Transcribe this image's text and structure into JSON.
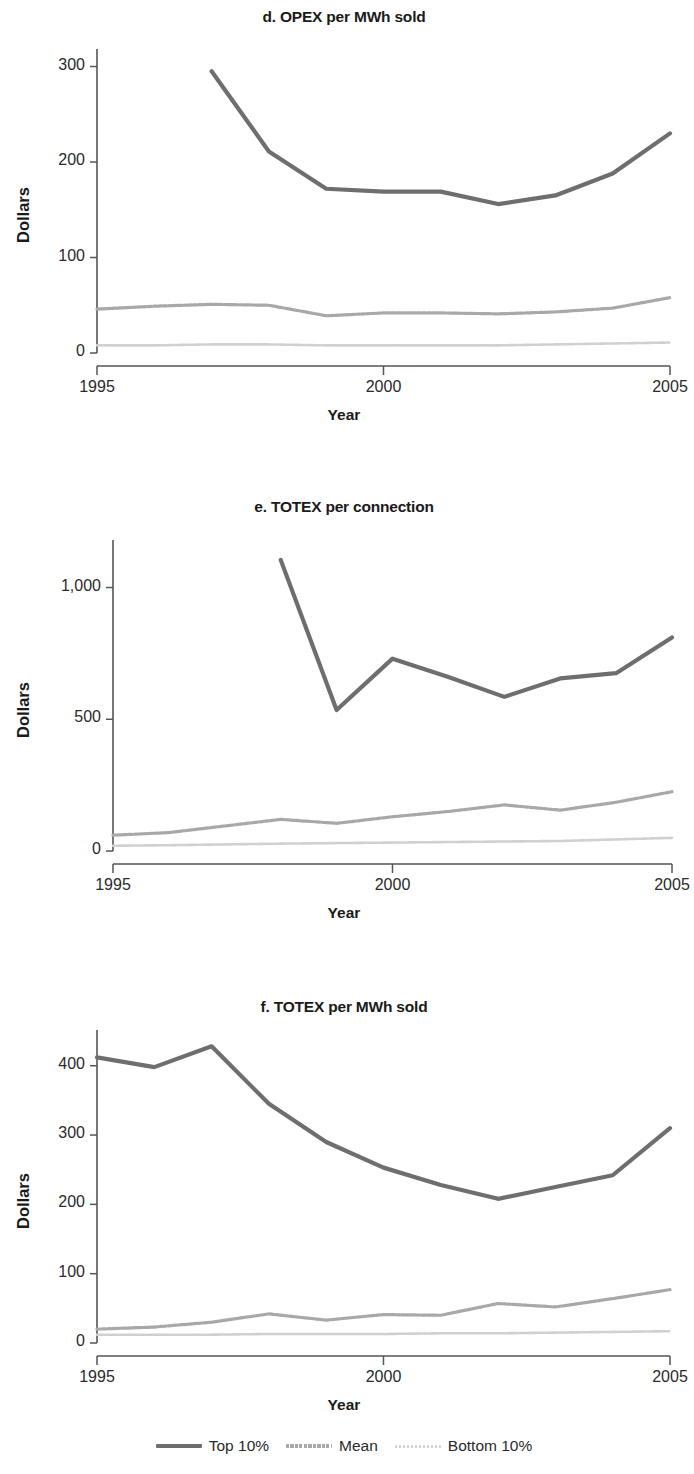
{
  "figure": {
    "axis_label_y": "Dollars",
    "axis_label_x": "Year"
  },
  "legend": {
    "items": [
      {
        "label": "Top 10%",
        "key": "top",
        "color": "#6e6e6e",
        "style": "solid"
      },
      {
        "label": "Mean",
        "key": "mean",
        "color": "#a8a8a8",
        "style": "dashed"
      },
      {
        "label": "Bottom 10%",
        "key": "bottom",
        "color": "#d2d2d2",
        "style": "dotted"
      }
    ]
  },
  "chart_data": [
    {
      "type": "line",
      "title": "d. OPEX per MWh sold",
      "xlabel": "Year",
      "ylabel": "Dollars",
      "x": [
        1995,
        1996,
        1997,
        1998,
        1999,
        2000,
        2001,
        2002,
        2003,
        2004,
        2005
      ],
      "xlim": [
        1995,
        2005
      ],
      "ylim": [
        0,
        310
      ],
      "yticks": [
        0,
        100,
        200,
        300
      ],
      "ytick_labels": [
        "0",
        "100",
        "200",
        "300"
      ],
      "xticks": [
        1995,
        2000,
        2005
      ],
      "xtick_labels": [
        "1995",
        "2000",
        "2005"
      ],
      "grid": false,
      "legend_position": "bottom-shared",
      "series": [
        {
          "name": "Top 10%",
          "values": [
            null,
            null,
            295,
            211,
            172,
            169,
            169,
            156,
            165,
            188,
            230
          ]
        },
        {
          "name": "Mean",
          "values": [
            46,
            49,
            51,
            50,
            39,
            42,
            42,
            41,
            43,
            47,
            58
          ]
        },
        {
          "name": "Bottom 10%",
          "values": [
            8,
            8,
            9,
            9,
            8,
            8,
            8,
            8,
            9,
            10,
            11
          ]
        }
      ]
    },
    {
      "type": "line",
      "title": "e. TOTEX per connection",
      "xlabel": "Year",
      "ylabel": "Dollars",
      "x": [
        1995,
        1996,
        1997,
        1998,
        1999,
        2000,
        2001,
        2002,
        2003,
        2004,
        2005
      ],
      "xlim": [
        1995,
        2005
      ],
      "ylim": [
        0,
        1150
      ],
      "yticks": [
        0,
        500,
        1000
      ],
      "ytick_labels": [
        "0",
        "500",
        "1,000"
      ],
      "xticks": [
        1995,
        2000,
        2005
      ],
      "xtick_labels": [
        "1995",
        "2000",
        "2005"
      ],
      "grid": false,
      "legend_position": "bottom-shared",
      "series": [
        {
          "name": "Top 10%",
          "values": [
            null,
            null,
            null,
            1105,
            535,
            730,
            660,
            585,
            655,
            675,
            810
          ]
        },
        {
          "name": "Mean",
          "values": [
            60,
            70,
            95,
            120,
            105,
            130,
            150,
            175,
            155,
            185,
            225
          ]
        },
        {
          "name": "Bottom 10%",
          "values": [
            20,
            22,
            25,
            28,
            30,
            32,
            34,
            36,
            38,
            44,
            50
          ]
        }
      ]
    },
    {
      "type": "line",
      "title": "f. TOTEX per MWh sold",
      "xlabel": "Year",
      "ylabel": "Dollars",
      "x": [
        1995,
        1996,
        1997,
        1998,
        1999,
        2000,
        2001,
        2002,
        2003,
        2004,
        2005
      ],
      "xlim": [
        1995,
        2005
      ],
      "ylim": [
        0,
        440
      ],
      "yticks": [
        0,
        100,
        200,
        300,
        400
      ],
      "ytick_labels": [
        "0",
        "100",
        "200",
        "300",
        "400"
      ],
      "xticks": [
        1995,
        2000,
        2005
      ],
      "xtick_labels": [
        "1995",
        "2000",
        "2005"
      ],
      "grid": false,
      "legend_position": "bottom-shared",
      "series": [
        {
          "name": "Top 10%",
          "values": [
            412,
            398,
            428,
            345,
            290,
            253,
            228,
            208,
            225,
            242,
            310
          ]
        },
        {
          "name": "Mean",
          "values": [
            20,
            23,
            30,
            42,
            33,
            41,
            40,
            57,
            52,
            64,
            77
          ]
        },
        {
          "name": "Bottom 10%",
          "values": [
            12,
            12,
            12,
            13,
            13,
            13,
            14,
            14,
            15,
            16,
            17
          ]
        }
      ]
    }
  ]
}
